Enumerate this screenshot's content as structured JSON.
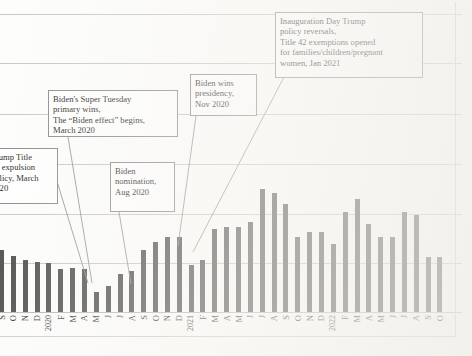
{
  "chart_data": {
    "type": "bar",
    "title": "",
    "subtitle": "",
    "xlabel": "",
    "ylabel": "",
    "grid": true,
    "legend": "none",
    "axis_note": "y-axis tick values not visible in the cropped screenshot; horizontal gridlines only",
    "gridline_count": 7,
    "categories": [
      "S",
      "O",
      "N",
      "D",
      "2020",
      "F",
      "M",
      "A",
      "M",
      "J",
      "J",
      "A",
      "S",
      "O",
      "N",
      "D",
      "2021",
      "F",
      "M",
      "A",
      "M",
      "J",
      "J",
      "A",
      "S",
      "O",
      "N",
      "D",
      "2022",
      "F",
      "M",
      "A",
      "M",
      "J",
      "J",
      "A",
      "S",
      "O"
    ],
    "period_start": "Sep 2019",
    "period_end": "Oct 2022",
    "values": [
      62,
      56,
      52,
      50,
      49,
      43,
      44,
      43,
      20,
      26,
      38,
      41,
      62,
      70,
      75,
      75,
      47,
      52,
      83,
      85,
      85,
      90,
      123,
      119,
      108,
      75,
      80,
      80,
      68,
      100,
      113,
      88,
      75,
      75,
      100,
      97,
      55,
      55
    ],
    "value_units": "relative bar height (px above axis, exact data labels not shown)"
  },
  "annotations": [
    {
      "id": "trump-title42",
      "text": "Trump Title\n42 expulsion\npolicy, March\n2020",
      "clipped_left": true,
      "full_text": "Trump Title 42 expulsion policy, March 2020"
    },
    {
      "id": "biden-super-tuesday",
      "text": "Biden's Super Tuesday\nprimary wins,\nThe “Biden effect” begins,\nMarch 2020"
    },
    {
      "id": "biden-nomination",
      "text": "Biden\nnomination,\nAug 2020"
    },
    {
      "id": "biden-wins-presidency",
      "text": "Biden wins\npresidency,\nNov 2020"
    },
    {
      "id": "inauguration-day",
      "text": "Inauguration Day Trump\npolicy reversals,\nTitle 42 exemptions opened\nfor families/children/pregnant\nwomen, Jan 2021"
    }
  ],
  "colors": {
    "bar": "#4b4b4b",
    "gridline": "#c9c7c2",
    "callout_border": "#8a8a8a",
    "leader_line": "#8d8d8d",
    "background": "#fdfdfc",
    "text": "#1d1d1d"
  }
}
